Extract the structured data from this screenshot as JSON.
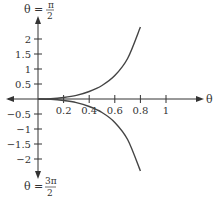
{
  "chart_data": {
    "type": "line",
    "title": "",
    "xlabel": "θ = 0",
    "ylabel_top": "θ = π/2",
    "ylabel_bottom": "θ = 3π/2",
    "x_ticks": [
      0.2,
      0.4,
      0.6,
      0.8,
      1
    ],
    "x_tick_labels": [
      "0.2",
      "0.4",
      "0.6",
      "0.8",
      "1"
    ],
    "y_ticks": [
      2,
      1.5,
      1,
      0.5,
      -0.5,
      -1,
      -1.5,
      -2
    ],
    "y_tick_labels": [
      "2",
      "1.5",
      "1",
      "0.5",
      "−0.5",
      "−1",
      "−1.5",
      "−2"
    ],
    "xlim": [
      -0.15,
      1.3
    ],
    "ylim": [
      -3.2,
      3.3
    ],
    "grid": false,
    "legend": null,
    "series": [
      {
        "name": "upper branch",
        "x": [
          0,
          0.1,
          0.2,
          0.3,
          0.4,
          0.5,
          0.6,
          0.7,
          0.8
        ],
        "y": [
          0,
          0.01,
          0.05,
          0.12,
          0.25,
          0.45,
          0.78,
          1.35,
          2.4
        ]
      },
      {
        "name": "lower branch",
        "x": [
          0,
          0.1,
          0.2,
          0.3,
          0.4,
          0.5,
          0.6,
          0.7,
          0.8
        ],
        "y": [
          0,
          -0.01,
          -0.05,
          -0.12,
          -0.25,
          -0.45,
          -0.78,
          -1.35,
          -2.4
        ]
      }
    ]
  },
  "labels": {
    "top_theta": "θ =",
    "top_num": "π",
    "top_den": "2",
    "bottom_theta": "θ =",
    "bottom_num": "3π",
    "bottom_den": "2",
    "right_axis": "θ = 0"
  },
  "colors": {
    "axis": "#333333",
    "curve": "#444444"
  }
}
